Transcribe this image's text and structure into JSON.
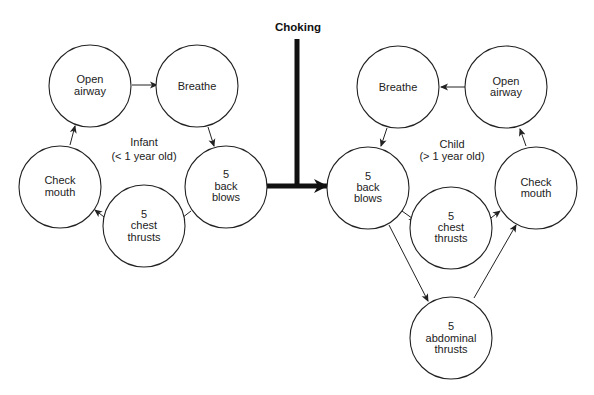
{
  "title": "Choking",
  "infant": {
    "label_line1": "Infant",
    "label_line2": "(< 1 year old)",
    "nodes": {
      "open_airway": [
        "Open",
        "airway"
      ],
      "breathe": [
        "Breathe"
      ],
      "back_blows": [
        "5",
        "back",
        "blows"
      ],
      "chest_thrusts": [
        "5",
        "chest",
        "thrusts"
      ],
      "check_mouth": [
        "Check",
        "mouth"
      ]
    }
  },
  "child": {
    "label_line1": "Child",
    "label_line2": "(> 1 year old)",
    "nodes": {
      "breathe": [
        "Breathe"
      ],
      "open_airway": [
        "Open",
        "airway"
      ],
      "back_blows": [
        "5",
        "back",
        "blows"
      ],
      "chest_thrusts": [
        "5",
        "chest",
        "thrusts"
      ],
      "abdominal_thrusts": [
        "5",
        "abdominal",
        "thrusts"
      ],
      "check_mouth": [
        "Check",
        "mouth"
      ]
    }
  },
  "edges": [
    "Infant: Open airway -> Breathe",
    "Infant: Breathe -> 5 back blows",
    "Infant: 5 back blows -> 5 chest thrusts",
    "Infant: 5 chest thrusts -> Check mouth",
    "Infant: Check mouth -> Open airway",
    "Choking -> Infant 5 back blows",
    "Choking -> Child 5 back blows",
    "Child: 5 back blows -> 5 chest thrusts",
    "Child: 5 back blows -> 5 abdominal thrusts",
    "Child: 5 chest thrusts -> Check mouth",
    "Child: 5 abdominal thrusts -> Check mouth",
    "Child: Check mouth -> Open airway",
    "Child: Open airway -> Breathe",
    "Child: Breathe -> 5 back blows"
  ]
}
